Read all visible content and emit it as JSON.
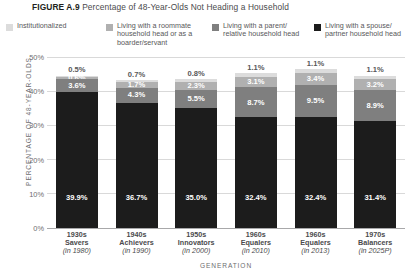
{
  "figure": {
    "number": "FIGURE A.9",
    "caption": "Percentage of 48-Year-Olds Not Heading a Household"
  },
  "legend": {
    "items": [
      {
        "label": "Institutionalized",
        "color": "#dcdcdc"
      },
      {
        "label": "Living with a roommate\nhousehold head or as a\nboarder/servant",
        "color": "#b0b0b0"
      },
      {
        "label": "Living with a parent/\nrelative household head",
        "color": "#7f7f7f"
      },
      {
        "label": "Living with a spouse/\npartner household head",
        "color": "#1c1c1c"
      }
    ]
  },
  "chart_data": {
    "type": "bar",
    "subtype": "stacked-bar",
    "title": "Percentage of 48-Year-Olds Not Heading a Household",
    "xlabel": "GENERATION",
    "ylabel": "PERCENTAGE OF 48-YEAR-OLDS",
    "ylim": [
      0,
      50
    ],
    "yticks": [
      "0%",
      "10%",
      "20%",
      "30%",
      "40%",
      "50%"
    ],
    "ytick_values": [
      0,
      10,
      20,
      30,
      40,
      50
    ],
    "grid": true,
    "legend_position": "top",
    "categories": [
      "1930s Savers (in 1980)",
      "1940s Achievers (in 1990)",
      "1950s Innovators (in 2000)",
      "1960s Equalers (in 2010)",
      "1960s Equalers (in 2013)",
      "1970s Balancers (in 2025P)"
    ],
    "category_labels": [
      {
        "decade": "1930s",
        "name": "Savers",
        "year": "(in 1980)"
      },
      {
        "decade": "1940s",
        "name": "Achievers",
        "year": "(in 1990)"
      },
      {
        "decade": "1950s",
        "name": "Innovators",
        "year": "(in 2000)"
      },
      {
        "decade": "1960s",
        "name": "Equalers",
        "year": "(in 2010)"
      },
      {
        "decade": "1960s",
        "name": "Equalers",
        "year": "(in 2013)"
      },
      {
        "decade": "1970s",
        "name": "Balancers",
        "year": "(in 2025P)"
      }
    ],
    "series": [
      {
        "name": "Living with a spouse/partner household head",
        "color": "#1c1c1c",
        "values": [
          39.9,
          36.7,
          35.0,
          32.4,
          32.4,
          31.4
        ],
        "labels": [
          "39.9%",
          "36.7%",
          "35.0%",
          "32.4%",
          "32.4%",
          "31.4%"
        ]
      },
      {
        "name": "Living with a parent/relative household head",
        "color": "#7f7f7f",
        "values": [
          3.6,
          4.3,
          5.5,
          8.7,
          9.5,
          8.9
        ],
        "labels": [
          "3.6%",
          "4.3%",
          "5.5%",
          "8.7%",
          "9.5%",
          "8.9%"
        ]
      },
      {
        "name": "Living with a roommate household head or as a boarder/servant",
        "color": "#b0b0b0",
        "values": [
          0.6,
          1.7,
          2.3,
          3.1,
          3.4,
          3.2
        ],
        "labels": [
          "0.6%",
          "1.7%",
          "2.3%",
          "3.1%",
          "3.4%",
          "3.2%"
        ]
      },
      {
        "name": "Institutionalized",
        "color": "#dcdcdc",
        "values": [
          0.5,
          0.7,
          0.8,
          1.1,
          1.1,
          1.1
        ],
        "labels": [
          "0.5%",
          "0.7%",
          "0.8%",
          "1.1%",
          "1.1%",
          "1.1%"
        ]
      }
    ],
    "totals": [
      44.6,
      43.4,
      43.6,
      45.3,
      46.4,
      44.6
    ]
  }
}
